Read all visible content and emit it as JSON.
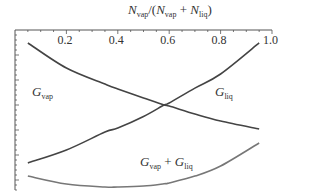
{
  "chart_data": {
    "type": "line",
    "title": "",
    "xlabel": "N_vap / (N_vap + N_liq)",
    "ylabel": "",
    "xlim": [
      0.0,
      1.0
    ],
    "ylim": [
      -1.0,
      0.0
    ],
    "x_axis_position": "top",
    "grid": false,
    "legend": "none (inline curve labels)",
    "x_ticks": [
      "0.2",
      "0.4",
      "0.6",
      "0.8",
      "1.0"
    ],
    "y_ticks": [],
    "x": [
      0.05,
      0.2,
      0.35,
      0.4,
      0.5,
      0.58,
      0.6,
      0.7,
      0.8,
      0.95
    ],
    "series": [
      {
        "name": "G_vap",
        "values": [
          -0.081,
          -0.238,
          -0.338,
          -0.369,
          -0.425,
          -0.469,
          -0.475,
          -0.525,
          -0.569,
          -0.619
        ]
      },
      {
        "name": "G_liq",
        "values": [
          -0.831,
          -0.75,
          -0.638,
          -0.613,
          -0.541,
          -0.469,
          -0.456,
          -0.363,
          -0.275,
          -0.081
        ]
      },
      {
        "name": "G_vap + G_liq",
        "values": [
          -0.913,
          -0.963,
          -0.981,
          -0.981,
          -0.975,
          -0.961,
          -0.956,
          -0.913,
          -0.85,
          -0.706
        ]
      }
    ],
    "annotations": [
      {
        "text": "G_vap",
        "x": 0.09,
        "y": -0.38
      },
      {
        "text": "G_liq",
        "x": 0.78,
        "y": -0.38
      },
      {
        "text": "G_vap + G_liq",
        "x": 0.49,
        "y": -0.83
      }
    ],
    "intersection": {
      "x": 0.58,
      "y": -0.469
    }
  },
  "labels": {
    "xaxis": {
      "N": "N",
      "vap": "vap",
      "slash": "/(",
      "N2": "N",
      "vap2": "vap",
      "plus": "+",
      "N3": "N",
      "liq": "liq",
      "close": ")"
    },
    "g_vap": {
      "G": "G",
      "sub": "vap"
    },
    "g_liq": {
      "G": "G",
      "sub": "liq"
    },
    "g_sum": {
      "G1": "G",
      "sub1": "vap",
      "plus": "+",
      "G2": "G",
      "sub2": "liq"
    }
  },
  "colors": {
    "axis": "#555555",
    "curve_dark": "#444444",
    "curve_light": "#777777"
  }
}
